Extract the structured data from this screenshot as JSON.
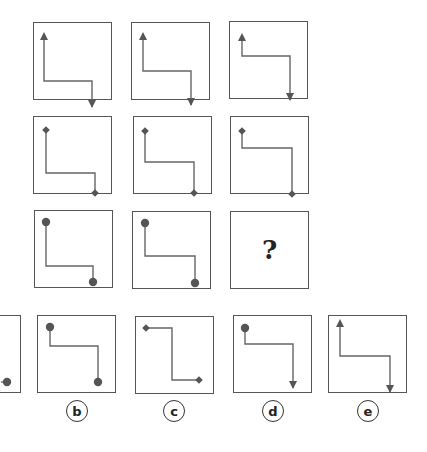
{
  "puzzle": {
    "grid": [
      [
        {
          "shape": "z-path",
          "orientation": "vertical-first",
          "start_marker": "arrow-up",
          "end_marker": "arrow-down"
        },
        {
          "shape": "z-path",
          "orientation": "vertical-first",
          "start_marker": "arrow-up",
          "end_marker": "arrow-down"
        },
        {
          "shape": "z-path",
          "orientation": "vertical-first",
          "start_marker": "arrow-up",
          "end_marker": "arrow-down"
        }
      ],
      [
        {
          "shape": "z-path",
          "orientation": "vertical-first",
          "start_marker": "diamond",
          "end_marker": "diamond"
        },
        {
          "shape": "z-path",
          "orientation": "vertical-first",
          "start_marker": "diamond",
          "end_marker": "diamond"
        },
        {
          "shape": "z-path",
          "orientation": "vertical-first",
          "start_marker": "diamond",
          "end_marker": "diamond"
        }
      ],
      [
        {
          "shape": "z-path",
          "orientation": "vertical-first",
          "start_marker": "dot",
          "end_marker": "dot"
        },
        {
          "shape": "z-path",
          "orientation": "vertical-first",
          "start_marker": "dot",
          "end_marker": "dot"
        },
        {
          "missing": true,
          "text": "?"
        }
      ]
    ],
    "options": [
      {
        "label": "a",
        "start_marker": "unknown",
        "end_marker": "dot",
        "partially_visible": true
      },
      {
        "label": "b",
        "shape": "z-path",
        "orientation": "vertical-first",
        "start_marker": "dot",
        "end_marker": "dot"
      },
      {
        "label": "c",
        "shape": "z-path",
        "orientation": "horizontal-first",
        "start_marker": "diamond",
        "end_marker": "diamond"
      },
      {
        "label": "d",
        "shape": "z-path",
        "orientation": "vertical-first",
        "start_marker": "dot",
        "end_marker": "arrow-down"
      },
      {
        "label": "e",
        "shape": "z-path",
        "orientation": "vertical-first",
        "start_marker": "arrow-up",
        "end_marker": "arrow-down"
      }
    ],
    "colors": {
      "line": "#666666",
      "marker": "#555555",
      "border": "#555555"
    }
  }
}
